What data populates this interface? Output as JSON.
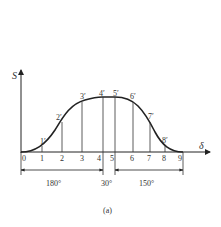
{
  "diagram": {
    "caption": "(a)",
    "y_axis_label": "S",
    "x_axis_label": "δ",
    "x_points": [
      "0",
      "1",
      "2",
      "3",
      "4",
      "5",
      "6",
      "7",
      "8",
      "9"
    ],
    "curve_points": [
      "1′",
      "2′",
      "3′",
      "4′",
      "5′",
      "6′",
      "7′",
      "8′"
    ],
    "segments": [
      {
        "label": "180°"
      },
      {
        "label": "30°"
      },
      {
        "label": "150°"
      }
    ],
    "colors": {
      "line": "#222222",
      "text": "#333333"
    }
  }
}
